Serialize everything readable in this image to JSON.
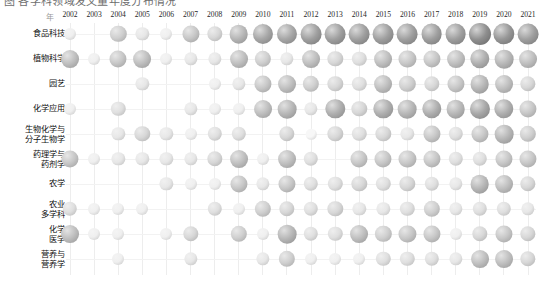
{
  "top_caption": {
    "text": "图  各学科领域发文量年度分布情况"
  },
  "chart_data": {
    "type": "heatmap",
    "subtype": "bubble-matrix",
    "title": "",
    "xlabel": "",
    "ylabel": "",
    "grid": true,
    "legend": "none",
    "corner_marker": "年",
    "value_encoding": "bubble area (grayscale sphere); larger/darker = higher count",
    "categories": [
      "2002",
      "2003",
      "2004",
      "2005",
      "2006",
      "2007",
      "2008",
      "2009",
      "2010",
      "2011",
      "2012",
      "2013",
      "2014",
      "2015",
      "2016",
      "2017",
      "2018",
      "2019",
      "2020",
      "2021"
    ],
    "rows": [
      "食品科技",
      "植物科学",
      "园艺",
      "化学应用",
      "生物化学与\n分子生物学",
      "药理学与\n药剂学",
      "农学",
      "农业\n多学科",
      "化学\n医学",
      "营养与\n营养学"
    ],
    "series": [
      {
        "name": "食品科技",
        "values": [
          3,
          0,
          7,
          4,
          3,
          8,
          6,
          10,
          12,
          12,
          13,
          13,
          13,
          13,
          13,
          13,
          13,
          15,
          14,
          13
        ]
      },
      {
        "name": "植物科学",
        "values": [
          9,
          3,
          8,
          9,
          3,
          4,
          4,
          9,
          7,
          4,
          9,
          6,
          5,
          9,
          8,
          8,
          9,
          11,
          10,
          9
        ]
      },
      {
        "name": "园艺",
        "values": [
          0,
          0,
          0,
          4,
          0,
          0,
          3,
          4,
          8,
          9,
          7,
          6,
          5,
          9,
          7,
          6,
          8,
          10,
          9,
          6
        ]
      },
      {
        "name": "化学应用",
        "values": [
          3,
          0,
          5,
          0,
          0,
          4,
          3,
          3,
          9,
          10,
          4,
          11,
          6,
          11,
          10,
          11,
          10,
          12,
          11,
          8
        ]
      },
      {
        "name": "生物化学与\n分子生物学",
        "values": [
          0,
          0,
          4,
          6,
          4,
          3,
          5,
          5,
          0,
          6,
          2,
          6,
          5,
          6,
          4,
          8,
          5,
          8,
          10,
          7
        ]
      },
      {
        "name": "药理学与\n药剂学",
        "values": [
          8,
          3,
          4,
          4,
          4,
          4,
          6,
          9,
          3,
          9,
          5,
          0,
          8,
          8,
          8,
          8,
          5,
          5,
          8,
          8
        ]
      },
      {
        "name": "农学",
        "values": [
          0,
          0,
          0,
          0,
          4,
          3,
          3,
          8,
          4,
          8,
          5,
          5,
          6,
          5,
          6,
          5,
          4,
          10,
          9,
          6
        ]
      },
      {
        "name": "农业\n多学科",
        "values": [
          5,
          3,
          3,
          3,
          0,
          0,
          5,
          3,
          7,
          6,
          5,
          6,
          4,
          4,
          5,
          7,
          4,
          5,
          5,
          4
        ]
      },
      {
        "name": "化学\n医学",
        "values": [
          9,
          3,
          3,
          0,
          3,
          6,
          0,
          7,
          3,
          10,
          5,
          5,
          9,
          7,
          8,
          8,
          3,
          6,
          8,
          6
        ]
      },
      {
        "name": "营养与\n营养学",
        "values": [
          0,
          0,
          3,
          0,
          0,
          4,
          0,
          0,
          4,
          7,
          3,
          3,
          3,
          5,
          5,
          5,
          4,
          9,
          9,
          6
        ]
      }
    ]
  },
  "style": {
    "grid_color": "#ededed",
    "bubble_light": "#f7f7f7",
    "bubble_dark": "#6e6e6e",
    "text_color": "#101010",
    "background": "#ffffff"
  }
}
